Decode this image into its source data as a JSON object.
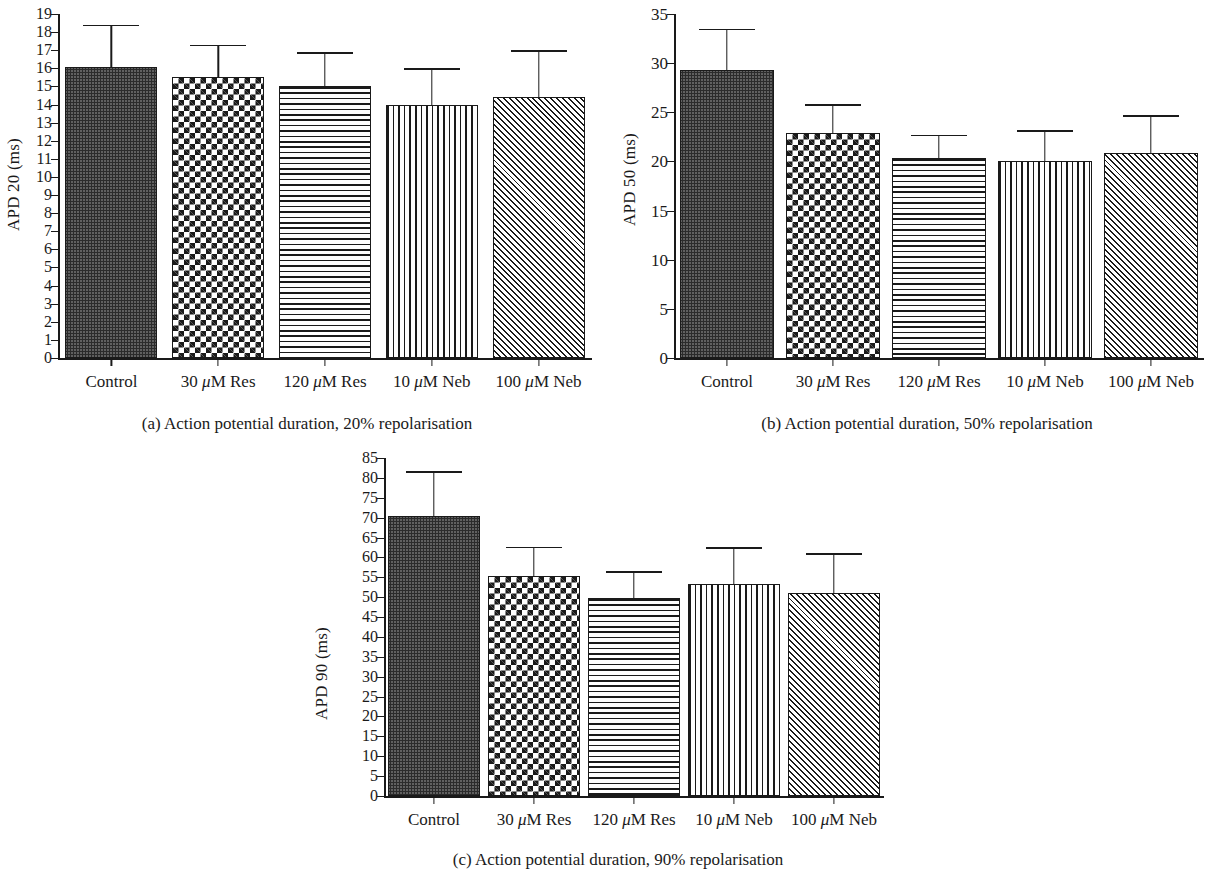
{
  "figure": {
    "categories": [
      "Control",
      "30 μM Res",
      "120 μM Res",
      "10 μM Neb",
      "100 μM Neb"
    ],
    "patterns": [
      "fine-dots",
      "checkerboard",
      "horizontal-lines",
      "vertical-lines",
      "diagonal-hatch"
    ],
    "ink_color": "#1a1a1a",
    "background_color": "#ffffff"
  },
  "chart_data": [
    {
      "id": "panel-a",
      "type": "bar",
      "title": "",
      "caption": "(a)  Action potential duration, 20% repolarisation",
      "caption_tag": "(a)",
      "caption_text": "Action potential duration, 20% repolarisation",
      "ylabel": "APD 20 (ms)",
      "xlabel": "",
      "ylim": [
        0,
        19
      ],
      "ytick_step": 1,
      "yticks": [
        0,
        1,
        2,
        3,
        4,
        5,
        6,
        7,
        8,
        9,
        10,
        11,
        12,
        13,
        14,
        15,
        16,
        17,
        18,
        19
      ],
      "ytick_labels": [
        "0",
        "1",
        "2",
        "3",
        "4",
        "5",
        "6",
        "7",
        "8",
        "9",
        "10",
        "11",
        "12",
        "13",
        "14",
        "15",
        "16",
        "17",
        "18",
        "19"
      ],
      "grid": false,
      "legend": "none",
      "categories": [
        "Control",
        "30 μM Res",
        "120 μM Res",
        "10 μM Neb",
        "100 μM Neb"
      ],
      "values": [
        16.1,
        15.5,
        15.0,
        14.0,
        14.4
      ],
      "error_upper": [
        18.4,
        17.3,
        16.9,
        16.0,
        17.0
      ],
      "patterns": [
        "fine-dots",
        "checkerboard",
        "horizontal-lines",
        "vertical-lines",
        "diagonal-hatch"
      ]
    },
    {
      "id": "panel-b",
      "type": "bar",
      "title": "",
      "caption": "(b)  Action potential duration, 50% repolarisation",
      "caption_tag": "(b)",
      "caption_text": "Action potential duration, 50% repolarisation",
      "ylabel": "APD 50 (ms)",
      "xlabel": "",
      "ylim": [
        0,
        35
      ],
      "ytick_step": 5,
      "yticks": [
        0,
        5,
        10,
        15,
        20,
        25,
        30,
        35
      ],
      "ytick_labels": [
        "0",
        "5",
        "10",
        "15",
        "20",
        "25",
        "30",
        "35"
      ],
      "grid": false,
      "legend": "none",
      "categories": [
        "Control",
        "30 μM Res",
        "120 μM Res",
        "10 μM Neb",
        "100 μM Neb"
      ],
      "values": [
        29.3,
        22.9,
        20.3,
        20.0,
        20.9
      ],
      "error_upper": [
        33.5,
        25.8,
        22.7,
        23.2,
        24.7
      ],
      "patterns": [
        "fine-dots",
        "checkerboard",
        "horizontal-lines",
        "vertical-lines",
        "diagonal-hatch"
      ]
    },
    {
      "id": "panel-c",
      "type": "bar",
      "title": "",
      "caption": "(c)  Action potential duration, 90% repolarisation",
      "caption_tag": "(c)",
      "caption_text": "Action potential duration, 90% repolarisation",
      "ylabel": "APD 90 (ms)",
      "xlabel": "",
      "ylim": [
        0,
        85
      ],
      "ytick_step": 5,
      "yticks": [
        0,
        5,
        10,
        15,
        20,
        25,
        30,
        35,
        40,
        45,
        50,
        55,
        60,
        65,
        70,
        75,
        80,
        85
      ],
      "ytick_labels": [
        "0",
        "5",
        "10",
        "15",
        "20",
        "25",
        "30",
        "35",
        "40",
        "45",
        "50",
        "55",
        "60",
        "65",
        "70",
        "75",
        "80",
        "85"
      ],
      "grid": false,
      "legend": "none",
      "categories": [
        "Control",
        "30 μM Res",
        "120 μM Res",
        "10 μM Neb",
        "100 μM Neb"
      ],
      "values": [
        70.5,
        55.4,
        49.8,
        53.3,
        51.0
      ],
      "error_upper": [
        81.7,
        62.7,
        56.5,
        62.5,
        61.0
      ],
      "patterns": [
        "fine-dots",
        "checkerboard",
        "horizontal-lines",
        "vertical-lines",
        "diagonal-hatch"
      ]
    }
  ]
}
